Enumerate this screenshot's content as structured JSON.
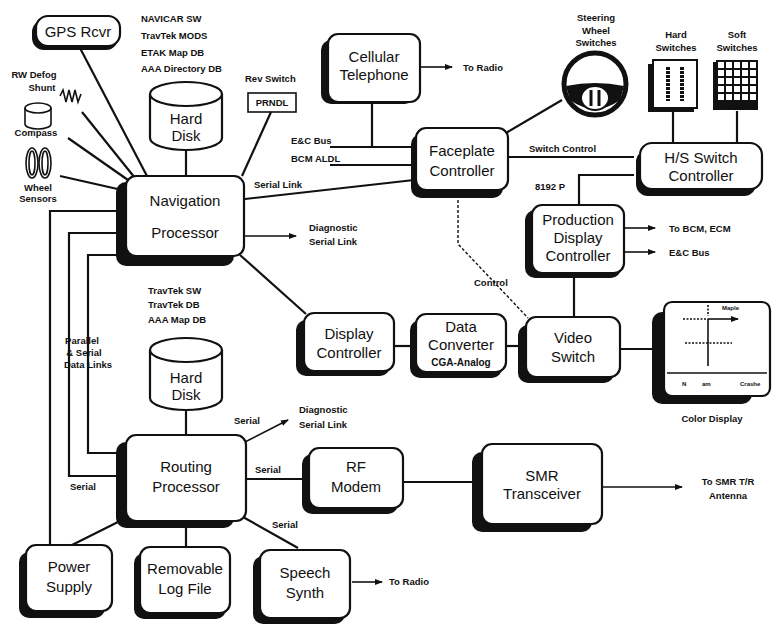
{
  "diagram": {
    "blocks": {
      "gps": {
        "line1": "GPS Rcvr"
      },
      "nav": {
        "line1": "Navigation",
        "line2": "Processor"
      },
      "cell": {
        "line1": "Cellular",
        "line2": "Telephone"
      },
      "faceplate": {
        "line1": "Faceplate",
        "line2": "Controller"
      },
      "hs_switch": {
        "line1": "H/S Switch",
        "line2": "Controller"
      },
      "prod_display": {
        "line1": "Production",
        "line2": "Display",
        "line3": "Controller"
      },
      "display_ctrl": {
        "line1": "Display",
        "line2": "Controller"
      },
      "data_conv": {
        "line1": "Data",
        "line2": "Converter",
        "line3": "CGA-Analog"
      },
      "video_switch": {
        "line1": "Video",
        "line2": "Switch"
      },
      "routing": {
        "line1": "Routing",
        "line2": "Processor"
      },
      "rf_modem": {
        "line1": "RF",
        "line2": "Modem"
      },
      "smr": {
        "line1": "SMR",
        "line2": "Transceiver"
      },
      "power": {
        "line1": "Power",
        "line2": "Supply"
      },
      "log_file": {
        "line1": "Removable",
        "line2": "Log File"
      },
      "speech": {
        "line1": "Speech",
        "line2": "Synth"
      }
    },
    "disks": {
      "nav_disk": {
        "line1": "Hard",
        "line2": "Disk",
        "contents": [
          "NAVICAR SW",
          "TravTek MODS",
          "ETAK Map DB",
          "AAA Directory DB"
        ]
      },
      "route_disk": {
        "line1": "Hard",
        "line2": "Disk",
        "contents": [
          "TravTek SW",
          "TravTek DB",
          "AAA Map DB"
        ]
      }
    },
    "sensors": {
      "rw_defog": {
        "line1": "RW Defog",
        "line2": "Shunt"
      },
      "compass": "Compass",
      "wheel": {
        "line1": "Wheel",
        "line2": "Sensors"
      },
      "rev_switch": "Rev Switch",
      "prndl": "PRNDL",
      "steering": {
        "line1": "Steering",
        "line2": "Wheel",
        "line3": "Switches"
      },
      "hard_switches": {
        "line1": "Hard",
        "line2": "Switches"
      },
      "soft_switches": {
        "line1": "Soft",
        "line2": "Switches"
      },
      "color_display": "Color Display",
      "color_display_screen": {
        "top": "Maple",
        "bottom_left": "N",
        "bottom_mid": "am",
        "bottom_right": "Crashe"
      }
    },
    "labels": {
      "to_radio_cell": "To Radio",
      "ec_bus_left": "E&C Bus",
      "bcm_aldl": "BCM ALDL",
      "serial_link": "Serial Link",
      "switch_control": "Switch Control",
      "p8192": "8192 P",
      "to_bcm_ecm": "To BCM, ECM",
      "ec_bus_right": "E&C Bus",
      "diag_nav_1": "Diagnostic",
      "diag_nav_2": "Serial Link",
      "control": "Control",
      "parallel_1": "Parallel",
      "parallel_2": "& Serial",
      "parallel_3": "Data Links",
      "serial_left": "Serial",
      "serial_diag": "Serial",
      "diag_route_1": "Diagnostic",
      "diag_route_2": "Serial Link",
      "serial_rf": "Serial",
      "serial_speech": "Serial",
      "to_smr_1": "To SMR T/R",
      "to_smr_2": "Antenna",
      "to_radio_speech": "To Radio"
    }
  }
}
